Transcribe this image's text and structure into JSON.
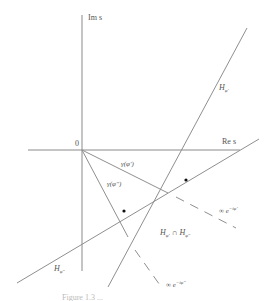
{
  "diagram": {
    "axes": {
      "real_label": "Re s",
      "imag_label": "Im s",
      "origin_label": "0"
    },
    "lines": {
      "h_phi_prime": "H",
      "h_phi_prime_sub": "φ'",
      "h_phi_dprime": "H",
      "h_phi_dprime_sub": "φ''"
    },
    "rays": {
      "gamma_phi_prime": "γ(φ')",
      "gamma_phi_dprime": "γ(φ'')",
      "inf_phi_prime": "∞ e",
      "inf_phi_prime_exp": "−iφ'",
      "inf_phi_dprime": "∞ e",
      "inf_phi_dprime_exp": "−iφ''"
    },
    "region": {
      "label_a": "H",
      "label_a_sub": "φ'",
      "cap": " ∩ ",
      "label_b": "H",
      "label_b_sub": "φ''"
    },
    "caption": "Figure 1.3 ..."
  }
}
